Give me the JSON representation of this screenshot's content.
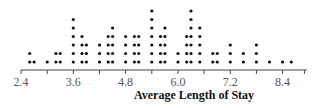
{
  "chart_data": {
    "type": "dot",
    "title": "",
    "xlabel": "Average Length of Stay",
    "ylabel": "",
    "xlim": [
      2.4,
      8.9
    ],
    "ticks": [
      2.4,
      3.0,
      3.6,
      4.2,
      4.8,
      5.4,
      6.0,
      6.6,
      7.2,
      7.8,
      8.4,
      8.9
    ],
    "tick_labels": [
      "2.4",
      "3.6",
      "4.8",
      "6.0",
      "7.2",
      "8.4"
    ],
    "grid": false,
    "legend": null,
    "points": [
      {
        "x": 2.6,
        "count": 2
      },
      {
        "x": 2.7,
        "count": 1
      },
      {
        "x": 3.0,
        "count": 1
      },
      {
        "x": 3.2,
        "count": 2
      },
      {
        "x": 3.3,
        "count": 2
      },
      {
        "x": 3.6,
        "count": 6
      },
      {
        "x": 3.8,
        "count": 4
      },
      {
        "x": 3.9,
        "count": 3
      },
      {
        "x": 4.2,
        "count": 3
      },
      {
        "x": 4.4,
        "count": 4
      },
      {
        "x": 4.5,
        "count": 5
      },
      {
        "x": 4.8,
        "count": 4
      },
      {
        "x": 5.0,
        "count": 4
      },
      {
        "x": 5.1,
        "count": 4
      },
      {
        "x": 5.4,
        "count": 7
      },
      {
        "x": 5.6,
        "count": 4
      },
      {
        "x": 5.7,
        "count": 5
      },
      {
        "x": 6.0,
        "count": 2
      },
      {
        "x": 6.2,
        "count": 4
      },
      {
        "x": 6.3,
        "count": 7
      },
      {
        "x": 6.5,
        "count": 5
      },
      {
        "x": 6.8,
        "count": 2
      },
      {
        "x": 6.9,
        "count": 2
      },
      {
        "x": 7.2,
        "count": 3
      },
      {
        "x": 7.5,
        "count": 2
      },
      {
        "x": 7.8,
        "count": 3
      },
      {
        "x": 8.1,
        "count": 1
      },
      {
        "x": 8.4,
        "count": 1
      },
      {
        "x": 8.6,
        "count": 1
      }
    ]
  },
  "style": {
    "dot_color": "#111111",
    "axis_color": "#444444"
  }
}
